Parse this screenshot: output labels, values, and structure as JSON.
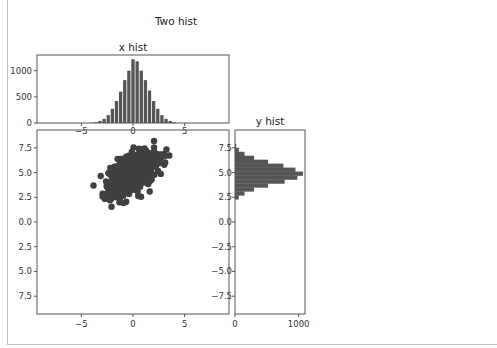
{
  "figure": {
    "suptitle": "Two hist"
  },
  "chart_data": [
    {
      "type": "bar",
      "title": "x hist",
      "xlabel": "",
      "ylabel": "",
      "xlim": [
        -9.3,
        9.3
      ],
      "ylim": [
        0,
        1300
      ],
      "xticks": [
        "−5",
        "0",
        "5"
      ],
      "yticks": [
        "0",
        "500",
        "1000"
      ],
      "bin_centers": [
        -4.0,
        -3.6,
        -3.2,
        -2.8,
        -2.4,
        -2.0,
        -1.6,
        -1.2,
        -0.8,
        -0.4,
        0.0,
        0.4,
        0.8,
        1.2,
        1.6,
        2.0,
        2.4,
        2.8,
        3.2,
        3.6,
        4.0
      ],
      "values": [
        5,
        15,
        40,
        80,
        150,
        270,
        420,
        600,
        820,
        1000,
        1220,
        1180,
        1000,
        820,
        620,
        420,
        270,
        150,
        80,
        40,
        15
      ],
      "color": "#555555"
    },
    {
      "type": "scatter",
      "title": "",
      "xlim": [
        -9.3,
        9.3
      ],
      "ylim": [
        -9.3,
        9.3
      ],
      "xticks": [
        "−5",
        "0",
        "5"
      ],
      "yticks": [
        "7.5",
        "5.0",
        "2.5",
        "0.0",
        "2.5",
        "5.0",
        "7.5"
      ],
      "description": "dense elliptical cloud of ~10000 points centred at (0, 5), x spread ~1.2, y spread ~1.0, positively correlated",
      "center": [
        0,
        5
      ],
      "color": "#404040"
    },
    {
      "type": "bar",
      "orientation": "horizontal",
      "title": "y hist",
      "xlim": [
        0,
        1100
      ],
      "ylim": [
        -9.3,
        9.3
      ],
      "xticks": [
        "0",
        "1000"
      ],
      "yticks": [
        "7.5",
        "5.0",
        "2.5",
        "0.0",
        "−2.5",
        "−5.0",
        "−7.5"
      ],
      "bin_centers": [
        2.5,
        2.9,
        3.3,
        3.7,
        4.1,
        4.5,
        4.9,
        5.3,
        5.7,
        6.1,
        6.5,
        6.9,
        7.3,
        7.7
      ],
      "values": [
        60,
        150,
        300,
        520,
        780,
        980,
        1070,
        950,
        760,
        520,
        300,
        150,
        60,
        20
      ],
      "color": "#555555"
    }
  ]
}
